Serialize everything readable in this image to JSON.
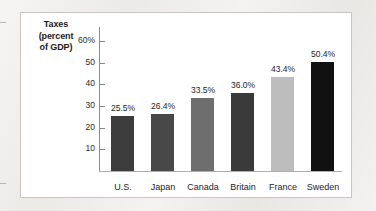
{
  "chart_data": {
    "type": "bar",
    "title": "",
    "ylabel": "Taxes (percent of GDP)",
    "ylabel_lines": [
      "Taxes",
      "(percent",
      "of GDP)"
    ],
    "xlabel": "",
    "categories": [
      "U.S.",
      "Japan",
      "Canada",
      "Britain",
      "France",
      "Sweden"
    ],
    "values": [
      25.5,
      26.4,
      33.5,
      36.0,
      43.4,
      50.4
    ],
    "value_labels": [
      "25.5%",
      "26.4%",
      "33.5%",
      "36.0%",
      "43.4%",
      "50.4%"
    ],
    "bar_colors": [
      "#3c3c3c",
      "#484848",
      "#6e6e6e",
      "#3a3a3a",
      "#bdbdbd",
      "#111111"
    ],
    "ylim": [
      0,
      65
    ],
    "ytick_values": [
      60,
      50,
      40,
      30,
      20,
      10
    ],
    "ytick_labels": [
      "60%",
      "50",
      "40",
      "30",
      "20",
      "10"
    ],
    "grid": false,
    "legend": "none",
    "axis_color": "#8d8b88",
    "panel_background": "#ffffff",
    "panel_border_color": "#c8c6c3"
  }
}
